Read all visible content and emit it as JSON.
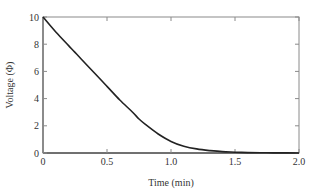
{
  "chart_data": {
    "type": "line",
    "title": "",
    "xlabel": "Time (min)",
    "ylabel": "Voltage (Φ)",
    "xlim": [
      0,
      2.0
    ],
    "ylim": [
      0,
      10
    ],
    "x_ticks": [
      "0",
      "0.5",
      "1.0",
      "1.5",
      "2.0"
    ],
    "y_ticks": [
      "0",
      "2",
      "4",
      "6",
      "8",
      "10"
    ],
    "grid": false,
    "legend": null,
    "series": [
      {
        "name": "Voltage",
        "color": "#222222",
        "x": [
          0,
          0.1,
          0.2,
          0.25,
          0.3,
          0.4,
          0.5,
          0.6,
          0.7,
          0.75,
          0.8,
          0.9,
          1.0,
          1.1,
          1.2,
          1.3,
          1.4,
          1.5,
          1.6,
          1.7,
          1.8,
          1.9,
          2.0
        ],
        "values": [
          10,
          8.9,
          7.9,
          7.4,
          6.9,
          5.9,
          4.9,
          3.9,
          3.0,
          2.5,
          2.1,
          1.4,
          0.85,
          0.5,
          0.3,
          0.18,
          0.1,
          0.06,
          0.03,
          0.02,
          0.01,
          0.005,
          0
        ]
      }
    ]
  },
  "axis": {
    "x_title": "Time (min)",
    "y_title": "Voltage (Φ)",
    "x_tick_labels": [
      "0",
      "0.5",
      "1.0",
      "1.5",
      "2.0"
    ],
    "y_tick_labels": [
      "0",
      "2",
      "4",
      "6",
      "8",
      "10"
    ]
  },
  "colors": {
    "frame": "#8a8a8a",
    "curve": "#222222",
    "text": "#333333"
  }
}
